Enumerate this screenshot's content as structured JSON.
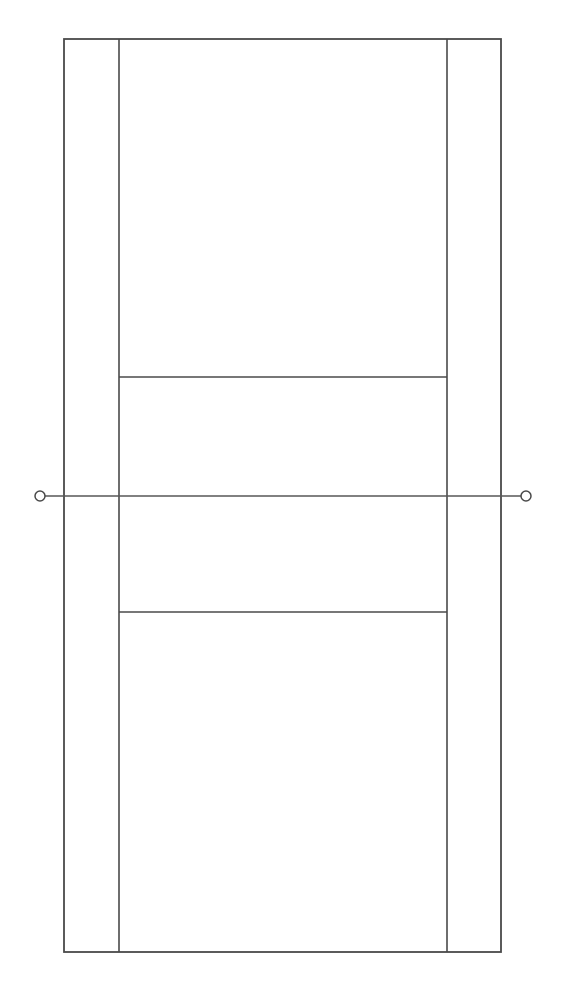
{
  "diagram": {
    "view": "overhead-plan",
    "background_color": "#ffffff",
    "line_color": "#4a4a4a",
    "net_line_color": "#575757",
    "canvas": {
      "width": 564,
      "height": 998
    },
    "geometry": {
      "doubles_court": {
        "left": 64,
        "top": 39,
        "right": 501,
        "bottom": 952
      },
      "singles_sideline_left_x": 119,
      "singles_sideline_right_x": 447,
      "service_line_top_y": 377,
      "service_line_bottom_y": 612,
      "net_line_y": 496,
      "net_line_left_x": 40,
      "net_line_right_x": 526,
      "net_post_radius": 5,
      "net_post_left": {
        "cx": 40,
        "cy": 496
      },
      "net_post_right": {
        "cx": 526,
        "cy": 496
      }
    },
    "elements": [
      {
        "name": "doubles-boundary",
        "label": "Doubles court outline"
      },
      {
        "name": "singles-sideline-left",
        "label": "Left singles sideline"
      },
      {
        "name": "singles-sideline-right",
        "label": "Right singles sideline"
      },
      {
        "name": "service-line-top",
        "label": "Top service line"
      },
      {
        "name": "service-line-bottom",
        "label": "Bottom service line"
      },
      {
        "name": "net-line",
        "label": "Net"
      },
      {
        "name": "net-post-left",
        "label": "Left net post"
      },
      {
        "name": "net-post-right",
        "label": "Right net post"
      }
    ]
  }
}
